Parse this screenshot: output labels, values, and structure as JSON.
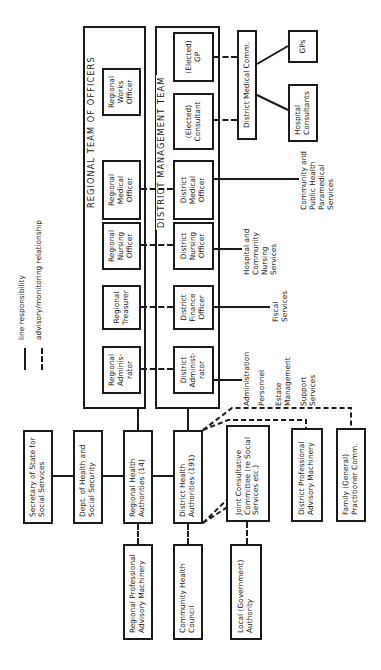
{
  "legend": {
    "line_responsibility": "line responsibility",
    "advisory_monitoring": "advisory/monitoring relationship"
  },
  "regional_team": {
    "title": "REGIONAL TEAM OF OFFICERS",
    "members": [
      "Regional Adminis-\nrator",
      "Regional Treasurer",
      "Regional Nursing Officer",
      "Regional Medical Officer",
      "Regional Works Officer"
    ]
  },
  "district_team": {
    "title": "DISTRICT MANAGEMENT TEAM",
    "members": [
      "District Administ-\nrator",
      "District Finance Officer",
      "District Nursing Officer",
      "District Medical Officer",
      "(Elected) Consultant",
      "(Elected) GP"
    ]
  },
  "medical_committee": {
    "dmc": "District Medical Comm.",
    "gps": "GPs",
    "hospital_consultants": "Hospital Consultants"
  },
  "services": {
    "administration": [
      "Administration",
      "Personnel",
      "Estate Management",
      "Support Services"
    ],
    "fiscal": "Fiscal Services",
    "nursing": "Hospital and Community Nursing Services",
    "public_health": "Community and Public Health Paramedical Services"
  },
  "hierarchy": {
    "secretary": "Secretary of State for Social Services",
    "dhss": "Dept. of Health and Social Security",
    "rha": "Regional Health Authorities (14)",
    "dha": "District Health Authorities (191)",
    "rpam": "Regional Professional Advisory Machinery",
    "chc": "Community Health Council",
    "jcc": "Joint Consultative Committee (re Social Services etc.)",
    "local_authority": "Local (Government) Authority",
    "dpam": "District Professional Advisory Machinery",
    "fpc": "Family (General) Practitioner Comm."
  }
}
